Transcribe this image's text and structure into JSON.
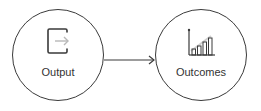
{
  "diagram": {
    "nodes": [
      {
        "id": "output",
        "label": "Output",
        "icon": "output-arrow-icon"
      },
      {
        "id": "outcomes",
        "label": "Outcomes",
        "icon": "bar-chart-growth-icon"
      }
    ],
    "edges": [
      {
        "from": "output",
        "to": "outcomes"
      }
    ],
    "colors": {
      "stroke": "#3a3a3a",
      "icon_light": "#b8b8b8",
      "text": "#333333"
    }
  }
}
